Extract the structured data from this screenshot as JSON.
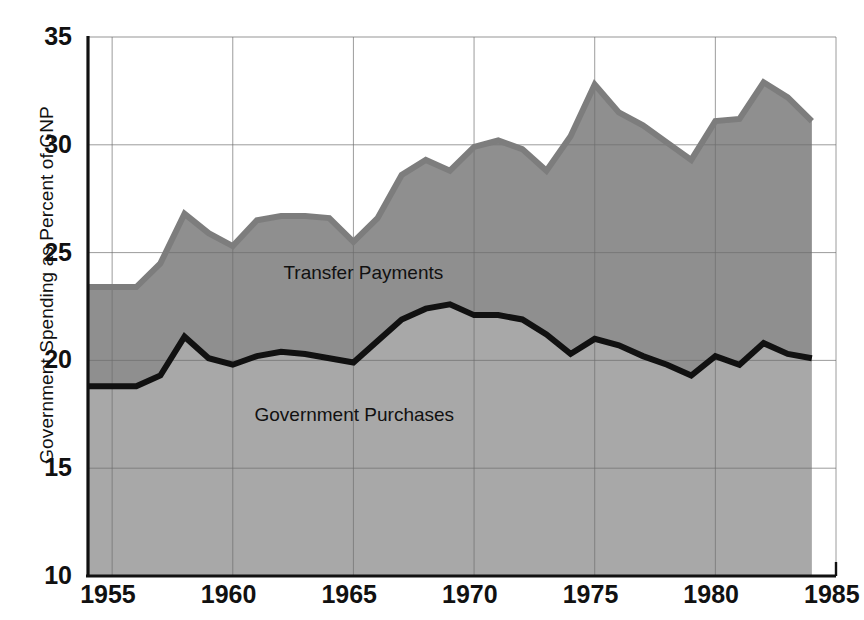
{
  "chart_data": {
    "type": "area",
    "title": "",
    "xlabel": "",
    "ylabel": "Government Spending as Percent of GNP",
    "xlim": [
      1954,
      1985
    ],
    "ylim": [
      10,
      35
    ],
    "grid": true,
    "legend_position": "inline-annotations",
    "xticks": [
      "1955",
      "1960",
      "1965",
      "1970",
      "1975",
      "1980",
      "1985"
    ],
    "xtick_values": [
      1955,
      1960,
      1965,
      1970,
      1975,
      1980,
      1985
    ],
    "yticks": [
      "10",
      "15",
      "20",
      "25",
      "30",
      "35"
    ],
    "ytick_values": [
      10,
      15,
      20,
      25,
      30,
      35
    ],
    "annotations": [
      {
        "text": "Transfer Payments",
        "x": 1962.1,
        "y": 24.0
      },
      {
        "text": "Government Purchases",
        "x": 1960.9,
        "y": 17.4
      }
    ],
    "x": [
      1954,
      1955,
      1956,
      1957,
      1958,
      1959,
      1960,
      1961,
      1962,
      1963,
      1964,
      1965,
      1966,
      1967,
      1968,
      1969,
      1970,
      1971,
      1972,
      1973,
      1974,
      1975,
      1976,
      1977,
      1978,
      1979,
      1980,
      1981,
      1982,
      1983,
      1984
    ],
    "series": [
      {
        "name": "Government Purchases",
        "color": "#111111",
        "values": [
          18.8,
          18.8,
          18.8,
          19.3,
          21.1,
          20.1,
          19.8,
          20.2,
          20.4,
          20.3,
          20.1,
          19.9,
          20.9,
          21.9,
          22.4,
          22.6,
          22.1,
          22.1,
          21.9,
          21.2,
          20.3,
          21.0,
          20.7,
          20.2,
          19.8,
          19.3,
          20.2,
          19.8,
          20.8,
          20.3,
          20.1
        ]
      },
      {
        "name": "Transfer Payments",
        "color": "#7d7d7d",
        "description": "upper boundary of stacked total government spending",
        "total_values": [
          23.4,
          23.4,
          23.4,
          24.5,
          26.8,
          25.9,
          25.3,
          26.5,
          26.7,
          26.7,
          26.6,
          25.5,
          26.6,
          28.6,
          29.3,
          28.8,
          29.9,
          30.2,
          29.8,
          28.8,
          30.4,
          32.8,
          31.5,
          30.9,
          30.1,
          29.3,
          31.1,
          31.2,
          32.9,
          32.2,
          31.1
        ]
      }
    ],
    "area_fill_lower": "#a8a8a8",
    "area_fill_upper": "#8f8f8f",
    "background": "#ffffff",
    "axis_color": "#111111",
    "grid_color": "#6d6d6d"
  }
}
